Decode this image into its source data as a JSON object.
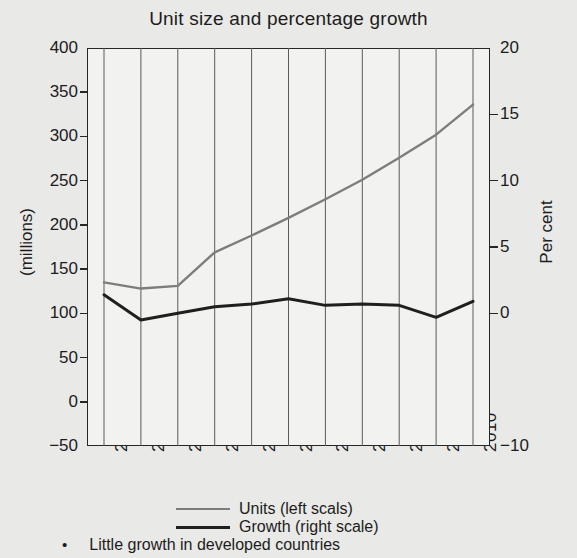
{
  "chart_data": {
    "type": "line",
    "title": "Unit size and percentage growth",
    "xlabel": "",
    "ylabel": "(millions)",
    "y2label": "Per cent",
    "x": [
      "2000",
      "2001",
      "2002",
      "2003",
      "2004",
      "2005",
      "2006",
      "2007",
      "2008",
      "2009",
      "2010"
    ],
    "categories": [
      "2000",
      "2001",
      "2002",
      "2003",
      "2004",
      "2005",
      "2006",
      "2007",
      "2008",
      "2009",
      "2010"
    ],
    "ylim": [
      -50,
      400
    ],
    "y2lim": [
      -10,
      20
    ],
    "yticks": [
      "400",
      "350",
      "300",
      "250",
      "200",
      "150",
      "100",
      "50",
      "0",
      "-50"
    ],
    "ytick_values": [
      400,
      350,
      300,
      250,
      200,
      150,
      100,
      50,
      0,
      -50
    ],
    "y2ticks": [
      "20",
      "15",
      "10",
      "5",
      "0",
      "-10"
    ],
    "y2tick_values": [
      20,
      15,
      10,
      5,
      0,
      -10
    ],
    "grid": "vertical",
    "legend_position": "bottom-center",
    "series": [
      {
        "name": "Units (left scals)",
        "axis": "left",
        "color": "#7d7d7d",
        "values": [
          135,
          128,
          131,
          169,
          188,
          208,
          229,
          251,
          276,
          302,
          336
        ]
      },
      {
        "name": "Growth (right scale)",
        "axis": "right",
        "color": "#1f1f1f",
        "values": [
          1.4,
          -0.5,
          0.0,
          0.5,
          0.7,
          1.1,
          0.6,
          0.7,
          0.6,
          -0.3,
          0.9
        ]
      }
    ],
    "legend": [
      {
        "label": "Units (left scals)",
        "color": "#7d7d7d"
      },
      {
        "label": "Growth (right scale)",
        "color": "#1f1f1f"
      }
    ]
  },
  "caption": {
    "bullet_glyph": "•",
    "text": "Little growth in developed countries"
  },
  "colors": {
    "background": "#e9e9e7",
    "plot_background": "#f2f2f0",
    "axis": "#262626",
    "gridline": "#5a5a5a",
    "text": "#1c1c1c",
    "units_line": "#7d7d7d",
    "growth_line": "#1f1f1f"
  }
}
